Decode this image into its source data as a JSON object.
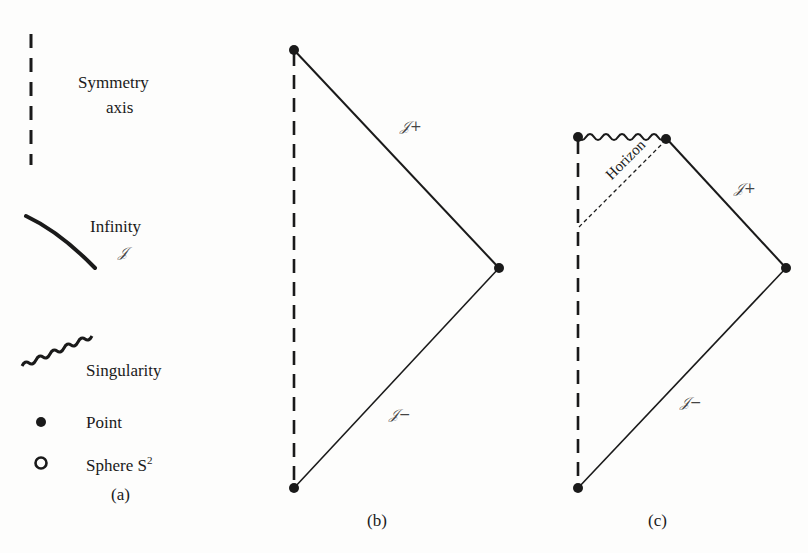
{
  "legend": {
    "items": [
      {
        "symbol": "dashed-line",
        "label_line1": "Symmetry",
        "label_line2": "axis"
      },
      {
        "symbol": "solid-curve",
        "label_line1": "Infinity",
        "label_line2": "𝒥"
      },
      {
        "symbol": "wavy-line",
        "label_line1": "Singularity"
      },
      {
        "symbol": "filled-dot",
        "label_line1": "Point"
      },
      {
        "symbol": "open-circle",
        "label_line1": "Sphere S",
        "sup": "2"
      }
    ],
    "caption": "(a)"
  },
  "diagram_b": {
    "scri_plus": "𝒥+",
    "scri_minus": "𝒥−",
    "caption": "(b)"
  },
  "diagram_c": {
    "scri_plus": "𝒥+",
    "scri_minus": "𝒥−",
    "horizon": "Horizon",
    "caption": "(c)"
  },
  "colors": {
    "ink": "#1a1a1a",
    "background": "#fdfdfc"
  }
}
